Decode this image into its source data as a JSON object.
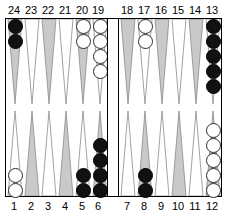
{
  "board": {
    "title": "backgammon-board",
    "colors": {
      "point_shaded": "#c9c9c9",
      "point_light": "#ffffff",
      "point_outline": "#8a8a8a",
      "border": "#000000",
      "checker_white": "#ffffff",
      "checker_black": "#111111",
      "background": "#ffffff"
    },
    "top_labels": [
      "24",
      "23",
      "22",
      "21",
      "20",
      "19",
      "18",
      "17",
      "16",
      "15",
      "14",
      "13"
    ],
    "bottom_labels": [
      "1",
      "2",
      "3",
      "4",
      "5",
      "6",
      "7",
      "8",
      "9",
      "10",
      "11",
      "12"
    ],
    "points": [
      {
        "label": "24",
        "quadrant": "top-left",
        "slot": 0,
        "shaded": true,
        "checkers": 2,
        "color": "black"
      },
      {
        "label": "23",
        "quadrant": "top-left",
        "slot": 1,
        "shaded": false,
        "checkers": 0,
        "color": null
      },
      {
        "label": "22",
        "quadrant": "top-left",
        "slot": 2,
        "shaded": true,
        "checkers": 0,
        "color": null
      },
      {
        "label": "21",
        "quadrant": "top-left",
        "slot": 3,
        "shaded": false,
        "checkers": 0,
        "color": null
      },
      {
        "label": "20",
        "quadrant": "top-left",
        "slot": 4,
        "shaded": true,
        "checkers": 2,
        "color": "white"
      },
      {
        "label": "19",
        "quadrant": "top-left",
        "slot": 5,
        "shaded": false,
        "checkers": 4,
        "color": "white"
      },
      {
        "label": "18",
        "quadrant": "top-right",
        "slot": 0,
        "shaded": true,
        "checkers": 0,
        "color": null
      },
      {
        "label": "17",
        "quadrant": "top-right",
        "slot": 1,
        "shaded": false,
        "checkers": 2,
        "color": "white"
      },
      {
        "label": "16",
        "quadrant": "top-right",
        "slot": 2,
        "shaded": true,
        "checkers": 0,
        "color": null
      },
      {
        "label": "15",
        "quadrant": "top-right",
        "slot": 3,
        "shaded": false,
        "checkers": 0,
        "color": null
      },
      {
        "label": "14",
        "quadrant": "top-right",
        "slot": 4,
        "shaded": true,
        "checkers": 0,
        "color": null
      },
      {
        "label": "13",
        "quadrant": "top-right",
        "slot": 5,
        "shaded": false,
        "checkers": 5,
        "color": "black"
      },
      {
        "label": "1",
        "quadrant": "bottom-left",
        "slot": 0,
        "shaded": false,
        "checkers": 2,
        "color": "white"
      },
      {
        "label": "2",
        "quadrant": "bottom-left",
        "slot": 1,
        "shaded": true,
        "checkers": 0,
        "color": null
      },
      {
        "label": "3",
        "quadrant": "bottom-left",
        "slot": 2,
        "shaded": false,
        "checkers": 0,
        "color": null
      },
      {
        "label": "4",
        "quadrant": "bottom-left",
        "slot": 3,
        "shaded": true,
        "checkers": 0,
        "color": null
      },
      {
        "label": "5",
        "quadrant": "bottom-left",
        "slot": 4,
        "shaded": false,
        "checkers": 2,
        "color": "black"
      },
      {
        "label": "6",
        "quadrant": "bottom-left",
        "slot": 5,
        "shaded": true,
        "checkers": 4,
        "color": "black"
      },
      {
        "label": "7",
        "quadrant": "bottom-right",
        "slot": 0,
        "shaded": false,
        "checkers": 0,
        "color": null
      },
      {
        "label": "8",
        "quadrant": "bottom-right",
        "slot": 1,
        "shaded": true,
        "checkers": 2,
        "color": "black"
      },
      {
        "label": "9",
        "quadrant": "bottom-right",
        "slot": 2,
        "shaded": false,
        "checkers": 0,
        "color": null
      },
      {
        "label": "10",
        "quadrant": "bottom-right",
        "slot": 3,
        "shaded": true,
        "checkers": 0,
        "color": null
      },
      {
        "label": "11",
        "quadrant": "bottom-right",
        "slot": 4,
        "shaded": false,
        "checkers": 0,
        "color": null
      },
      {
        "label": "12",
        "quadrant": "bottom-right",
        "slot": 5,
        "shaded": true,
        "checkers": 5,
        "color": "white"
      }
    ],
    "bar": {
      "white_checkers": 0,
      "black_checkers": 0
    }
  }
}
